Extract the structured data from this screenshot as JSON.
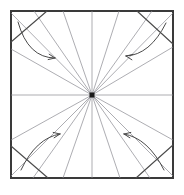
{
  "diagram": {
    "type": "origami-folding-instruction",
    "canvas": {
      "width": 184,
      "height": 195,
      "background": "#ffffff"
    },
    "colors": {
      "paper_border": "#3a3a3a",
      "crease_line": "#8a8a90",
      "fold_crease": "#4a4a4a",
      "arrow": "#4a4a4a",
      "center_dot": "#1a1a1a",
      "paper_fill": "#ffffff"
    },
    "square": {
      "label": "paper-sheet",
      "x": 11,
      "y": 11,
      "width": 162,
      "height": 167,
      "stroke_width": 1.4
    },
    "center_point": {
      "label": "center-dot",
      "x": 92,
      "y": 95,
      "size": 5
    },
    "radiating_creases": {
      "label": "radial-crease-lines",
      "count": 16,
      "stroke_width": 0.7,
      "endpoints": [
        {
          "name": "north",
          "x": 92,
          "y": 11
        },
        {
          "name": "north-ne-1",
          "x": 119,
          "y": 11
        },
        {
          "name": "north-ne-2",
          "x": 152,
          "y": 11
        },
        {
          "name": "corner-ne",
          "x": 173,
          "y": 13
        },
        {
          "name": "east-ne",
          "x": 173,
          "y": 47
        },
        {
          "name": "east",
          "x": 173,
          "y": 95
        },
        {
          "name": "east-se",
          "x": 173,
          "y": 140
        },
        {
          "name": "corner-se",
          "x": 173,
          "y": 176
        },
        {
          "name": "south-se-2",
          "x": 150,
          "y": 178
        },
        {
          "name": "south-se-1",
          "x": 120,
          "y": 178
        },
        {
          "name": "south",
          "x": 92,
          "y": 178
        },
        {
          "name": "south-sw-1",
          "x": 63,
          "y": 178
        },
        {
          "name": "south-sw-2",
          "x": 33,
          "y": 178
        },
        {
          "name": "corner-sw",
          "x": 11,
          "y": 176
        },
        {
          "name": "west-sw",
          "x": 11,
          "y": 140
        },
        {
          "name": "west",
          "x": 11,
          "y": 95
        },
        {
          "name": "west-nw",
          "x": 11,
          "y": 49
        },
        {
          "name": "corner-nw",
          "x": 11,
          "y": 13
        },
        {
          "name": "north-nw-2",
          "x": 34,
          "y": 11
        },
        {
          "name": "north-nw-1",
          "x": 63,
          "y": 11
        }
      ]
    },
    "corner_fold_creases": {
      "label": "corner-fold-crease-lines",
      "stroke_width": 1.1,
      "lines": [
        {
          "name": "crease-top-left",
          "x1": 11,
          "y1": 42,
          "x2": 47,
          "y2": 11
        },
        {
          "name": "crease-top-right",
          "x1": 137,
          "y1": 11,
          "x2": 173,
          "y2": 44
        },
        {
          "name": "crease-bottom-left",
          "x1": 11,
          "y1": 146,
          "x2": 48,
          "y2": 178
        },
        {
          "name": "crease-bottom-right",
          "x1": 136,
          "y1": 178,
          "x2": 173,
          "y2": 145
        }
      ]
    },
    "fold_arrows": {
      "label": "corner-fold-direction-arrows",
      "count": 4,
      "stroke_width": 1.0,
      "items": [
        {
          "name": "arrow-top-left",
          "direction": "fold corner toward center (down-right)",
          "start": {
            "x": 18,
            "y": 22
          },
          "control": {
            "x": 28,
            "y": 58
          },
          "end": {
            "x": 55,
            "y": 58
          },
          "head_angle_deg": 10
        },
        {
          "name": "arrow-top-right",
          "direction": "fold corner toward center (down-left)",
          "start": {
            "x": 166,
            "y": 23
          },
          "control": {
            "x": 150,
            "y": 55
          },
          "end": {
            "x": 126,
            "y": 56
          },
          "head_angle_deg": 190
        },
        {
          "name": "arrow-bottom-left",
          "direction": "fold corner toward center (up-right)",
          "start": {
            "x": 21,
            "y": 170
          },
          "control": {
            "x": 36,
            "y": 138
          },
          "end": {
            "x": 60,
            "y": 134
          },
          "head_angle_deg": 350
        },
        {
          "name": "arrow-bottom-right",
          "direction": "fold corner toward center (up-left)",
          "start": {
            "x": 164,
            "y": 170
          },
          "control": {
            "x": 148,
            "y": 138
          },
          "end": {
            "x": 124,
            "y": 134
          },
          "head_angle_deg": 190
        }
      ]
    }
  }
}
